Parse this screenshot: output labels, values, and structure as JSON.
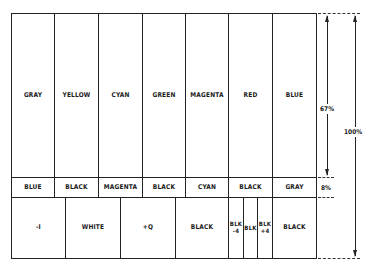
{
  "top_row": [
    {
      "label": "GRAY"
    },
    {
      "label": "YELLOW"
    },
    {
      "label": "CYAN"
    },
    {
      "label": "GREEN"
    },
    {
      "label": "MAGENTA"
    },
    {
      "label": "RED"
    },
    {
      "label": "BLUE"
    }
  ],
  "middle_row": [
    {
      "label": "BLUE"
    },
    {
      "label": "BLACK"
    },
    {
      "label": "MAGENTA"
    },
    {
      "label": "BLACK"
    },
    {
      "label": "CYAN"
    },
    {
      "label": "BLACK"
    },
    {
      "label": "GRAY"
    }
  ],
  "bottom_row": [
    {
      "label": "-I"
    },
    {
      "label": "WHITE"
    },
    {
      "label": "+Q"
    },
    {
      "label": "BLACK"
    },
    {
      "label": "BLK\n-4"
    },
    {
      "label": "BLK"
    },
    {
      "label": "BLK\n+4"
    },
    {
      "label": "BLACK"
    }
  ],
  "dimensions": {
    "top_height": "67%",
    "middle_height": "8%",
    "total_height": "100%"
  }
}
